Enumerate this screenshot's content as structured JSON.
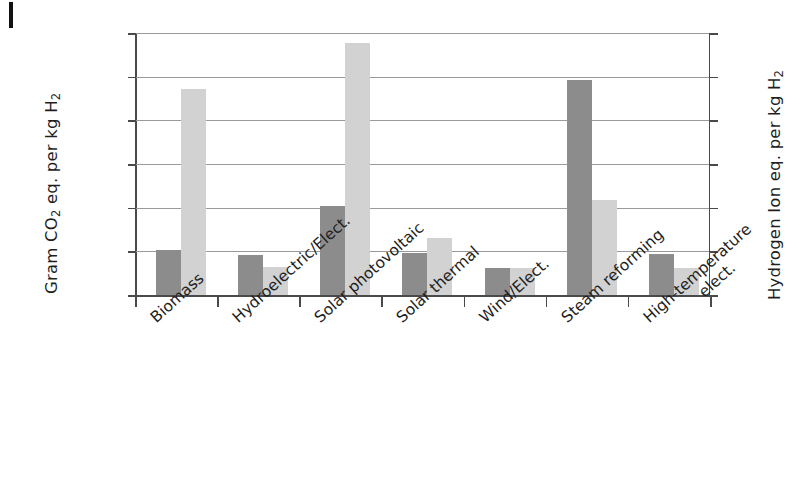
{
  "figure": {
    "margin_tick": "page-margin-mark"
  },
  "chart_data": {
    "type": "bar",
    "title": "",
    "xlabel": "",
    "categories": [
      "Biomass",
      "Hydroelectric/Elect.",
      "Solar photovoltaic",
      "Solar thermal",
      "Wind/Elect.",
      "Steam reforming",
      "High-temperature elect."
    ],
    "series": [
      {
        "name": "Gram CO2 eq. per kg H2",
        "axis": "left",
        "color": "#8c8c8c",
        "values": [
          2600,
          2300,
          5080,
          2420,
          1560,
          12300,
          2330
        ]
      },
      {
        "name": "Hydrogen Ion eq. per kg H2",
        "axis": "right",
        "color": "#d2d2d2",
        "values_left_scale": [
          11790,
          1580,
          14420,
          3260,
          1560,
          5450,
          1570
        ],
        "values": [
          0.943,
          0.126,
          1.154,
          0.261,
          0.125,
          0.436,
          0.126
        ]
      }
    ],
    "left_axis": {
      "label": "Gram CO2 eq. per kg H2",
      "label_html": "Gram CO<sub>2</sub> eq. per kg H<sub>2</sub>",
      "ticks": [
        0,
        2500,
        5000,
        7500,
        10000,
        12500,
        15000
      ],
      "tick_labels": [
        "0",
        "2500",
        "5000",
        "7500",
        "10000",
        "12500",
        "15000"
      ],
      "ylim": [
        0,
        15000
      ]
    },
    "right_axis": {
      "label": "Hydrogen Ion eq. per kg H2",
      "label_html": "Hydrogen Ion eq. per kg H<sub>2</sub>",
      "ticks": [
        0,
        0.2,
        0.4,
        0.6,
        0.8,
        1.0,
        1.2
      ],
      "tick_labels": [
        "0",
        "0.2",
        "0.4",
        "0.6",
        "0.8",
        "1.0",
        "1.2"
      ],
      "ylim": [
        0,
        1.2
      ]
    },
    "grid": true,
    "legend": "none"
  }
}
